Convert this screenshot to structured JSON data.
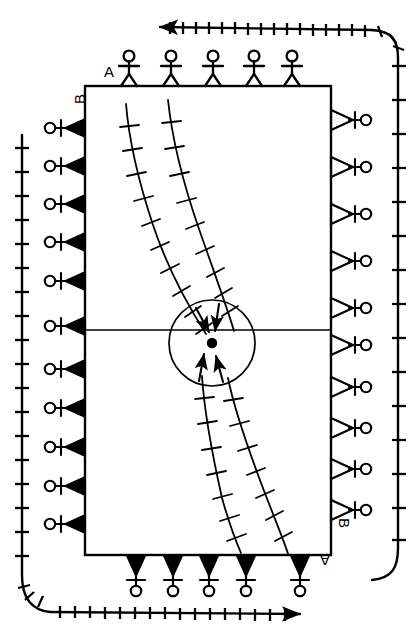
{
  "figure": {
    "kind": "structural-geology-block-diagram",
    "background_color": "#ffffff",
    "ink_color": "#000000",
    "width": 419,
    "height": 639
  },
  "labels": [
    {
      "id": "a-top",
      "text": "A",
      "x": 104,
      "y": 64,
      "rotation": 0,
      "name": "label-a-top"
    },
    {
      "id": "b-left",
      "text": "B",
      "x": 72,
      "y": 88,
      "rotation": -90,
      "name": "label-b-left"
    },
    {
      "id": "b-right",
      "text": "B",
      "x": 345,
      "y": 522,
      "rotation": 90,
      "name": "label-b-right"
    },
    {
      "id": "a-bottom",
      "text": "A",
      "x": 322,
      "y": 552,
      "rotation": 180,
      "name": "label-a-bottom"
    }
  ],
  "block": {
    "name": "central-block",
    "x": 85,
    "y": 86,
    "width": 246,
    "height": 469,
    "stroke_width": 2.2,
    "median_line_y": 330
  },
  "focus": {
    "name": "focal-point-circle",
    "center_x": 212,
    "center_y": 343,
    "radius": 43,
    "dot_radius": 5.2,
    "dot_x": 212,
    "dot_y": 343,
    "stroke_width": 1.6
  },
  "convergent_arrows": {
    "name": "convergence-arrows",
    "count": 4,
    "from_above": 2,
    "from_below": 2
  },
  "fold_curves": [
    {
      "name": "fold-axis-left-upper",
      "points": "126,104 129,126 133,150 138,175 145,201 153,225 163,249 174,272 186,295 197,317 206,334",
      "ticks": 11
    },
    {
      "name": "fold-axis-right-upper",
      "points": "168,100 171,124 176,150 182,177 190,204 199,229 209,253 219,276 226,297 231,315 234,331",
      "ticks": 11
    },
    {
      "name": "fold-axis-left-lower",
      "points": "202,376 204,398 207,423 211,449 216,474 222,498 229,520 236,540 241,553",
      "ticks": 9
    },
    {
      "name": "fold-axis-right-lower",
      "points": "228,378 233,400 240,424 248,449 257,473 266,496 275,518 283,540 288,554",
      "ticks": 9
    }
  ],
  "boundary_markers": {
    "top": {
      "name": "boundary-markers-top",
      "type": "stick-figures-upright",
      "count": 5,
      "edge": "A",
      "xs": [
        129,
        171,
        213,
        255,
        292
      ]
    },
    "bottom": {
      "name": "boundary-markers-bottom",
      "type": "filled-triangle-with-inverted-stick-figure",
      "count": 5,
      "edge": "A",
      "xs": [
        136,
        173,
        209,
        246,
        300
      ]
    },
    "left": {
      "name": "boundary-markers-left",
      "type": "filled-triangle-left-with-circle",
      "count": 9,
      "edge": "B",
      "ys": [
        128,
        166,
        204,
        242,
        281,
        326,
        369,
        408,
        447,
        486,
        524
      ]
    },
    "right": {
      "name": "boundary-markers-right",
      "type": "open-triangle-right-with-circle",
      "count": 9,
      "edge": "B",
      "ys": [
        120,
        167,
        214,
        261,
        308,
        345,
        387,
        428,
        469,
        510
      ]
    }
  },
  "outer_circuit": {
    "name": "outer-rotation-path",
    "description": "rounded rectangular tick-marked path with arrowheads",
    "stroke_width": 2.4,
    "tick_length": 9,
    "arrow_top": {
      "direction": "left",
      "x": 152,
      "y": 25
    },
    "arrow_bottom": {
      "direction": "right",
      "x": 290,
      "y": 613
    },
    "tick_counts": {
      "top": 17,
      "right": 13,
      "bottom": 17,
      "left": 13
    }
  }
}
